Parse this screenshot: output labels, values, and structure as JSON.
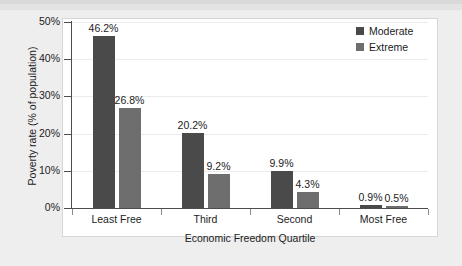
{
  "chart_data": {
    "type": "bar",
    "title": "",
    "subtitle": "",
    "xlabel": "Economic Freedom Quartile",
    "ylabel": "Poverty rate (% of population)",
    "categories": [
      "Least Free",
      "Third",
      "Second",
      "Most Free"
    ],
    "series": [
      {
        "name": "Moderate",
        "color": "#4a4a4a",
        "values": [
          46.2,
          20.2,
          9.9,
          0.9
        ],
        "labels": [
          "46.2%",
          "20.2%",
          "9.9%",
          "0.9%"
        ]
      },
      {
        "name": "Extreme",
        "color": "#6e6e6e",
        "values": [
          26.8,
          9.2,
          4.3,
          0.5
        ],
        "labels": [
          "26.8%",
          "9.2%",
          "4.3%",
          "0.5%"
        ]
      }
    ],
    "ylim": [
      0,
      50
    ],
    "yticks": [
      0,
      10,
      20,
      30,
      40,
      50
    ],
    "ytick_labels": [
      "0%",
      "10%",
      "20%",
      "30%",
      "40%",
      "50%"
    ],
    "grid": "horizontal",
    "legend_position": "top-right",
    "data_labels": true
  },
  "legend": {
    "items": [
      {
        "label": "Moderate",
        "color": "#4a4a4a"
      },
      {
        "label": "Extreme",
        "color": "#6e6e6e"
      }
    ]
  },
  "colors": {
    "page_background": "#eeeeee",
    "panel_background": "#ffffff",
    "axis": "#4d4d4d",
    "gridline": "#ebebeb",
    "text": "#1c1c1c"
  }
}
